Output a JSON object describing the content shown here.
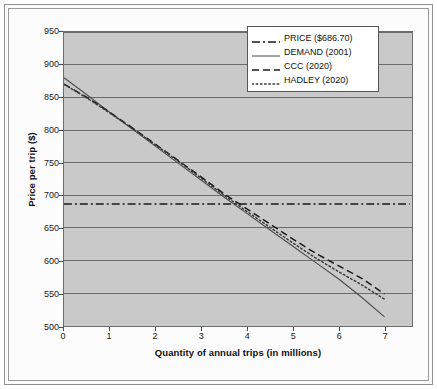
{
  "chart_data": {
    "type": "line",
    "title": "",
    "xlabel": "Quantity of annual trips (in millions)",
    "ylabel": "Price per trip ($)",
    "xlim": [
      0,
      7.6
    ],
    "ylim": [
      500,
      950
    ],
    "xticks": [
      0,
      1,
      2,
      3,
      4,
      5,
      6,
      7
    ],
    "xtick_labels": [
      "0",
      "1",
      "2",
      "3",
      "4",
      "5",
      "6",
      "7"
    ],
    "yticks": [
      500,
      550,
      600,
      650,
      700,
      750,
      800,
      850,
      900,
      950
    ],
    "ytick_labels": [
      "500",
      "550",
      "600",
      "650",
      "700",
      "750",
      "800",
      "850",
      "900",
      "950"
    ],
    "grid": "horizontal",
    "legend_position": "top-right",
    "plot_background": "#c9c9c9",
    "series": [
      {
        "name": "PRICE ($686.70)",
        "style": "dash-dot",
        "color": "#1a1a1a",
        "x": [
          0,
          7.55
        ],
        "values": [
          686.7,
          686.7
        ]
      },
      {
        "name": "DEMAND (2001)",
        "style": "solid",
        "color": "#4d4d4d",
        "x": [
          0,
          0.5,
          1,
          1.5,
          2,
          2.5,
          3,
          3.5,
          4,
          4.5,
          5,
          5.5,
          6,
          6.5,
          7
        ],
        "values": [
          880,
          854,
          827,
          801,
          775,
          749,
          723,
          697,
          672,
          647,
          622,
          597,
          572,
          544,
          514
        ]
      },
      {
        "name": "CCC (2020)",
        "style": "dashed",
        "color": "#1a1a1a",
        "x": [
          0,
          0.5,
          1,
          1.5,
          2,
          2.5,
          3,
          3.5,
          4,
          4.5,
          5,
          5.5,
          6,
          6.5,
          7
        ],
        "values": [
          870,
          850,
          827,
          803,
          778,
          753,
          728,
          702,
          679,
          656,
          633,
          611,
          592,
          573,
          549
        ]
      },
      {
        "name": "HADLEY (2020)",
        "style": "dotted",
        "color": "#3a3a3a",
        "x": [
          0,
          0.5,
          1,
          1.5,
          2,
          2.5,
          3,
          3.5,
          4,
          4.5,
          5,
          5.5,
          6,
          6.5,
          7
        ],
        "values": [
          870,
          849,
          826,
          802,
          777,
          752,
          726,
          700,
          675,
          651,
          627,
          604,
          583,
          563,
          541
        ]
      }
    ]
  },
  "legend": {
    "entries": [
      {
        "label": "PRICE ($686.70)"
      },
      {
        "label": "DEMAND (2001)"
      },
      {
        "label": "CCC (2020)"
      },
      {
        "label": "HADLEY (2020)"
      }
    ]
  },
  "axes": {
    "x_title": "Quantity of annual trips (in millions)",
    "y_title": "Price per trip ($)",
    "y_labels": [
      "950",
      "900",
      "850",
      "800",
      "750",
      "700",
      "650",
      "600",
      "550",
      "500"
    ],
    "x_labels": [
      "0",
      "1",
      "2",
      "3",
      "4",
      "5",
      "6",
      "7"
    ]
  }
}
